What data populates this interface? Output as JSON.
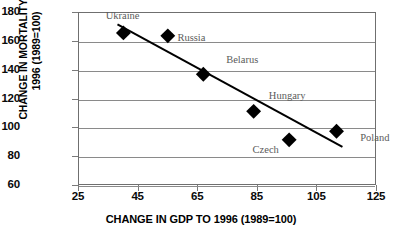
{
  "chart_data": {
    "type": "scatter",
    "title": "",
    "xlabel": "CHANGE IN GDP TO 1996 (1989=100)",
    "ylabel_line1": "CHANGE IN MORTALITY TO",
    "ylabel_line2": "1996 (1989=100)",
    "xlim": [
      25,
      125
    ],
    "ylim": [
      60,
      180
    ],
    "xticks": [
      "25",
      "45",
      "65",
      "85",
      "105",
      "125"
    ],
    "yticks": [
      "180",
      "160",
      "140",
      "120",
      "100",
      "80",
      "60"
    ],
    "grid": "horizontal",
    "legend": "none",
    "marker": "filled-diamond",
    "marker_color": "#000000",
    "trendline": {
      "type": "linear",
      "x_start": 38,
      "y_start": 172,
      "x_end": 114,
      "y_end": 86,
      "color": "#000000"
    },
    "points": [
      {
        "label": "Ukraine",
        "x": 40,
        "y": 166,
        "label_dx": -18,
        "label_dy": -22
      },
      {
        "label": "Russia",
        "x": 55,
        "y": 164,
        "label_dx": 9,
        "label_dy": -3
      },
      {
        "label": "Belarus",
        "x": 67,
        "y": 137,
        "label_dx": 22,
        "label_dy": -20
      },
      {
        "label": "Hungary",
        "x": 84,
        "y": 111,
        "label_dx": 14,
        "label_dy": -21
      },
      {
        "label": "Czech",
        "x": 96,
        "y": 91,
        "label_dx": -38,
        "label_dy": 4
      },
      {
        "label": "Poland",
        "x": 112,
        "y": 97,
        "label_dx": 22,
        "label_dy": 0
      }
    ],
    "series_name": "Countries"
  }
}
